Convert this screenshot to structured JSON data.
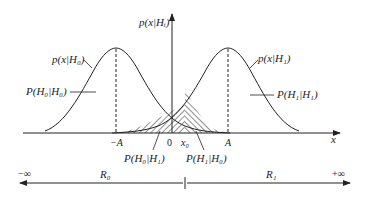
{
  "diagram": {
    "y_axis_label": "p(x|Hᵢ)",
    "x_axis_label": "x",
    "curves": [
      {
        "label": "p(x|H₀)",
        "mean_label": "−A",
        "region_label": "P(H₀|H₀)"
      },
      {
        "label": "p(x|H₁)",
        "mean_label": "A",
        "region_label": "P(H₁|H₁)"
      }
    ],
    "ticks": {
      "origin": "0",
      "threshold": "x₀"
    },
    "error_labels": {
      "miss": "P(H₀|H₁)",
      "false_alarm": "P(H₁|H₀)"
    },
    "decision_line": {
      "left_end": "−∞",
      "right_end": "+∞",
      "left_region": "R₀",
      "right_region": "R₁"
    },
    "colors": {
      "stroke": "#222222",
      "background": "#ffffff"
    }
  }
}
